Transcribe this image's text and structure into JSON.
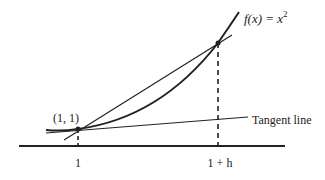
{
  "diagram": {
    "function_label": "f(x) = x",
    "function_exponent": "2",
    "point_label": "(1, 1)",
    "tangent_label": "Tangent line",
    "x_ticks": [
      {
        "label": "1"
      },
      {
        "label": "1 + h"
      }
    ],
    "colors": {
      "line": "#222222",
      "background": "#ffffff"
    }
  }
}
